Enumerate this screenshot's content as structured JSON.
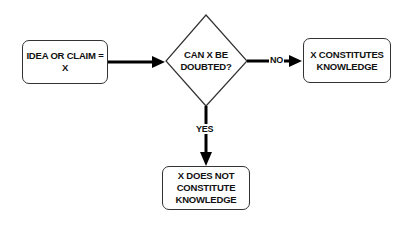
{
  "diagram": {
    "type": "flowchart",
    "nodes": {
      "start": {
        "label": "IDEA OR CLAIM = X",
        "shape": "rounded-rectangle"
      },
      "decision": {
        "label": "CAN X BE DOUBTED?",
        "line1": "CAN X BE",
        "line2": "DOUBTED?",
        "shape": "diamond"
      },
      "no_result": {
        "label": "X CONSTITUTES KNOWLEDGE",
        "line1": "X CONSTITUTES",
        "line2": "KNOWLEDGE",
        "shape": "rounded-rectangle"
      },
      "yes_result": {
        "label": "X DOES NOT CONSTITUTE KNOWLEDGE",
        "line1": "X DOES NOT",
        "line2": "CONSTITUTE",
        "line3": "KNOWLEDGE",
        "shape": "rounded-rectangle"
      }
    },
    "edges": [
      {
        "from": "start",
        "to": "decision",
        "label": ""
      },
      {
        "from": "decision",
        "to": "no_result",
        "label": "NO"
      },
      {
        "from": "decision",
        "to": "yes_result",
        "label": "YES"
      }
    ],
    "edge_labels": {
      "no": "NO",
      "yes": "YES"
    }
  }
}
